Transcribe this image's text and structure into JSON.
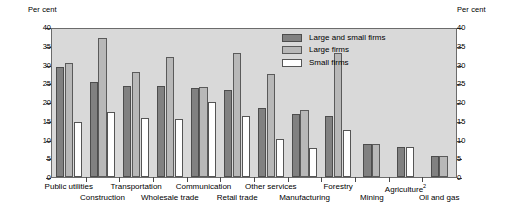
{
  "axis_titles": {
    "left": "Per cent",
    "right": "Per cent"
  },
  "legend": {
    "items": [
      {
        "label": "Large and small firms",
        "color": "#818181",
        "key": "large_and_small"
      },
      {
        "label": "Large firms",
        "color": "#b8b8b8",
        "key": "large"
      },
      {
        "label": "Small firms",
        "color": "#ffffff",
        "key": "small"
      }
    ]
  },
  "chart_data": {
    "type": "bar",
    "title": "",
    "xlabel": "",
    "ylabel": "Per cent",
    "ylim": [
      0,
      40
    ],
    "yticks": [
      0,
      5,
      10,
      15,
      20,
      25,
      30,
      35,
      40
    ],
    "ytick_labels": [
      "0",
      "5",
      "10",
      "15",
      "20",
      "25",
      "30",
      "35",
      "40"
    ],
    "grid": false,
    "legend_position": "top-center-right",
    "dual_axis": true,
    "categories": [
      "Public utilities",
      "Construction",
      "Transportation",
      "Wholesale trade",
      "Communication",
      "Retail trade",
      "Other services",
      "Manufacturing",
      "Forestry",
      "Mining",
      "Agriculture",
      "Oil and gas"
    ],
    "category_footnotes": {
      "Agriculture": "2"
    },
    "series": [
      {
        "name": "Large and small firms",
        "values": [
          29.3,
          25.3,
          24.4,
          24.4,
          23.7,
          23.2,
          18.4,
          16.8,
          16.3,
          8.8,
          8.0,
          5.5
        ]
      },
      {
        "name": "Large firms",
        "values": [
          30.3,
          37.2,
          28.0,
          32.0,
          23.9,
          33.1,
          27.5,
          18.0,
          33.2,
          8.7,
          null,
          5.5
        ]
      },
      {
        "name": "Small firms",
        "values": [
          14.7,
          17.4,
          15.7,
          15.4,
          20.1,
          16.3,
          10.1,
          7.7,
          12.6,
          null,
          8.1,
          null
        ]
      }
    ]
  }
}
